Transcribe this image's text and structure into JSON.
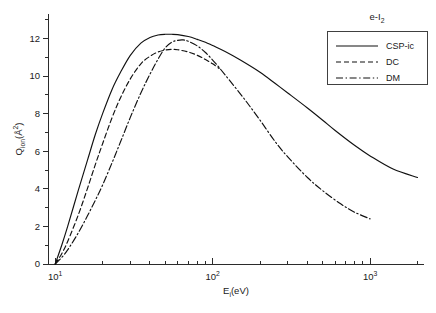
{
  "figure": {
    "background_color": "#ffffff",
    "line_color": "#111111",
    "axis_color": "#2b2b2b"
  },
  "annotation": {
    "system_label_prefix": "e-I",
    "system_label_sub": "2",
    "system_label_full": "e-I2"
  },
  "axes": {
    "x": {
      "label_main": "E",
      "label_sub": "i",
      "label_units": "(eV)",
      "label_full": "Ei(eV)",
      "scale": "log",
      "min": 9,
      "max": 2200,
      "major_ticks": [
        10,
        100,
        1000
      ],
      "major_tick_labels": [
        "10",
        "10",
        "10"
      ],
      "major_tick_exponents": [
        "1",
        "2",
        "3"
      ]
    },
    "y": {
      "label_main": "Q",
      "label_sub": "ion",
      "label_units": "(Å",
      "label_units_sup": "2",
      "label_units_close": ")",
      "label_full": "Qion(Å2)",
      "scale": "linear",
      "min": 0,
      "max": 13.3,
      "major_ticks": [
        0,
        2,
        4,
        6,
        8,
        10,
        12
      ],
      "major_tick_labels": [
        "0",
        "2",
        "4",
        "6",
        "8",
        "10",
        "12"
      ],
      "minor_tick_step": 1
    }
  },
  "legend": {
    "position": "top-right",
    "entries": [
      {
        "label": "CSP-ic",
        "style": "solid",
        "dasharray": ""
      },
      {
        "label": "DC",
        "style": "dashed",
        "dasharray": "5,3"
      },
      {
        "label": "DM",
        "style": "dashdot",
        "dasharray": "7,2.6,1.4,2.6"
      }
    ]
  },
  "chart_data": {
    "type": "line",
    "title": "e-I2",
    "xlabel": "Ei(eV)",
    "ylabel": "Qion(Å2)",
    "xscale": "log",
    "yscale": "linear",
    "xlim": [
      9,
      2200
    ],
    "ylim": [
      0,
      13.3
    ],
    "grid": false,
    "legend_position": "top-right",
    "series": [
      {
        "name": "CSP-ic",
        "style": "solid",
        "x": [
          10,
          11,
          12,
          14,
          16,
          18,
          20,
          23,
          26,
          30,
          35,
          40,
          45,
          50,
          55,
          60,
          70,
          80,
          90,
          100,
          120,
          150,
          200,
          250,
          300,
          400,
          500,
          600,
          800,
          1000,
          1400,
          2000
        ],
        "y": [
          0.0,
          1.0,
          2.0,
          3.9,
          5.5,
          6.9,
          8.0,
          9.3,
          10.2,
          11.1,
          11.75,
          12.05,
          12.18,
          12.22,
          12.22,
          12.2,
          12.1,
          11.95,
          11.8,
          11.62,
          11.3,
          10.85,
          10.2,
          9.6,
          9.1,
          8.3,
          7.65,
          7.1,
          6.3,
          5.75,
          5.05,
          4.6
        ]
      },
      {
        "name": "DC",
        "style": "dashed",
        "x": [
          10,
          11,
          12,
          14,
          16,
          18,
          20,
          23,
          26,
          30,
          35,
          40,
          45,
          50,
          55,
          60,
          70,
          80,
          90,
          100,
          110
        ],
        "y": [
          0.0,
          0.55,
          1.2,
          2.6,
          4.0,
          5.3,
          6.4,
          7.8,
          8.85,
          9.85,
          10.65,
          11.05,
          11.28,
          11.38,
          11.42,
          11.4,
          11.28,
          11.1,
          10.88,
          10.65,
          10.4
        ]
      },
      {
        "name": "DM",
        "style": "dashdot",
        "x": [
          10,
          11,
          12,
          14,
          16,
          18,
          20,
          23,
          26,
          30,
          35,
          40,
          45,
          50,
          55,
          60,
          65,
          70,
          80,
          90,
          100,
          110,
          130,
          160,
          200,
          250,
          300,
          400,
          500,
          650,
          800,
          1000
        ],
        "y": [
          0.0,
          0.35,
          0.75,
          1.65,
          2.55,
          3.4,
          4.2,
          5.4,
          6.5,
          7.8,
          9.1,
          10.1,
          10.9,
          11.5,
          11.8,
          11.9,
          11.92,
          11.85,
          11.6,
          11.25,
          10.85,
          10.45,
          9.7,
          8.75,
          7.65,
          6.5,
          5.7,
          4.6,
          3.9,
          3.2,
          2.75,
          2.4
        ]
      }
    ]
  }
}
